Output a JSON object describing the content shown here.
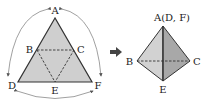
{
  "figure": {
    "net": {
      "labels": {
        "A": "A",
        "B": "B",
        "C": "C",
        "D": "D",
        "E": "E",
        "F": "F"
      }
    },
    "arrow": {
      "icon": "right-arrow-icon"
    },
    "tetrahedron": {
      "labels": {
        "top": "A(D, F)",
        "B": "B",
        "C": "C",
        "E": "E"
      }
    },
    "colors": {
      "fill_light": "#d4d4d4",
      "fill_dark": "#a9a9a9",
      "fill_mid": "#c2c2c2",
      "stroke": "#333333"
    }
  }
}
